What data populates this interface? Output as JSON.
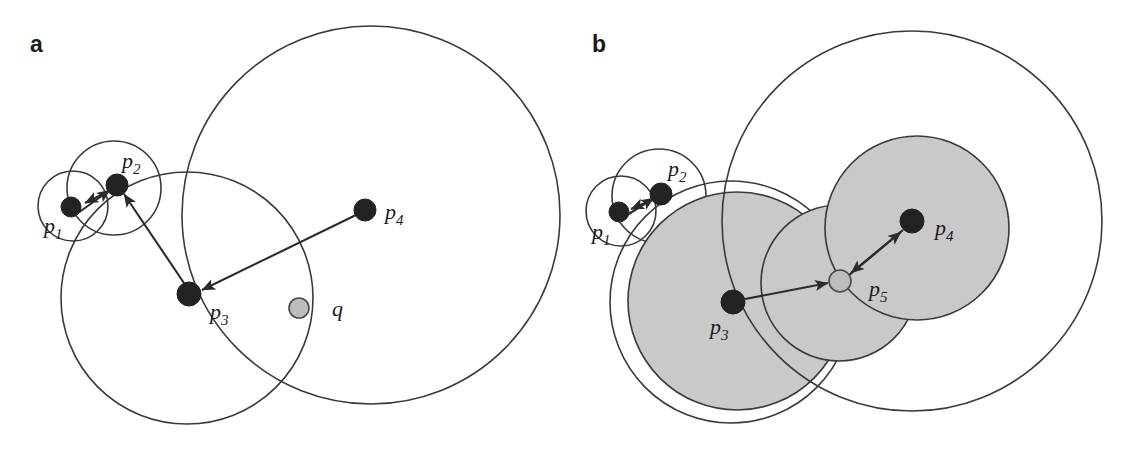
{
  "figure": {
    "background_color": "#ffffff",
    "stroke_color": "#3a3a3a",
    "shade_color": "#c9c9c9",
    "dark_point_color": "#232323",
    "light_point_color": "#bdbdbd",
    "width": 1131,
    "height": 451
  },
  "panels": [
    {
      "id": "a",
      "label": "a",
      "label_x": 30,
      "label_y": 52,
      "circles": [
        {
          "name": "circle-p1",
          "cx": 73,
          "cy": 206,
          "r": 35,
          "filled": false
        },
        {
          "name": "circle-p2",
          "cx": 114,
          "cy": 188,
          "r": 47,
          "filled": false
        },
        {
          "name": "circle-p3",
          "cx": 187,
          "cy": 298,
          "r": 126,
          "filled": false
        },
        {
          "name": "circle-p4",
          "cx": 371,
          "cy": 215,
          "r": 189,
          "filled": false
        }
      ],
      "points": [
        {
          "name": "point-p1",
          "cx": 71,
          "cy": 207,
          "r": 10,
          "shade": "dark"
        },
        {
          "name": "point-p2",
          "cx": 117,
          "cy": 185,
          "r": 11,
          "shade": "dark"
        },
        {
          "name": "point-p3",
          "cx": 189,
          "cy": 294,
          "r": 12,
          "shade": "dark"
        },
        {
          "name": "point-p4",
          "cx": 365,
          "cy": 210,
          "r": 11,
          "shade": "dark"
        },
        {
          "name": "point-q",
          "cx": 299,
          "cy": 308,
          "r": 10,
          "shade": "light"
        }
      ],
      "arrows": [
        {
          "name": "arrow-p2-to-p1",
          "x1": 117,
          "y1": 187,
          "x2": 85,
          "y2": 203
        },
        {
          "name": "arrow-p1-to-p2",
          "x1": 78,
          "y1": 213,
          "x2": 110,
          "y2": 190
        },
        {
          "name": "arrow-p3-to-p2",
          "x1": 186,
          "y1": 286,
          "x2": 124,
          "y2": 194
        },
        {
          "name": "arrow-p4-to-p3",
          "x1": 356,
          "y1": 215,
          "x2": 202,
          "y2": 290
        }
      ],
      "labels": [
        {
          "name": "label-p1",
          "base": "p",
          "sub": "1",
          "x": 44,
          "y": 233
        },
        {
          "name": "label-p2",
          "base": "p",
          "sub": "2",
          "x": 122,
          "y": 168
        },
        {
          "name": "label-p3",
          "base": "p",
          "sub": "3",
          "x": 210,
          "y": 319
        },
        {
          "name": "label-p4",
          "base": "p",
          "sub": "4",
          "x": 385,
          "y": 219
        },
        {
          "name": "label-q",
          "base": "q",
          "sub": "",
          "x": 332,
          "y": 316
        }
      ]
    },
    {
      "id": "b",
      "label": "b",
      "label_x": 592,
      "label_y": 52,
      "circles": [
        {
          "name": "circle-p1",
          "cx": 621,
          "cy": 211,
          "r": 35,
          "filled": false
        },
        {
          "name": "circle-p2",
          "cx": 659,
          "cy": 196,
          "r": 47,
          "filled": false
        },
        {
          "name": "circle-p3-outer",
          "cx": 731,
          "cy": 302,
          "r": 121,
          "filled": false
        },
        {
          "name": "circle-p3-shaded",
          "cx": 737,
          "cy": 301,
          "r": 109,
          "filled": true
        },
        {
          "name": "circle-p5-shaded",
          "cx": 839,
          "cy": 283,
          "r": 78,
          "filled": true
        },
        {
          "name": "circle-p4-shaded",
          "cx": 917,
          "cy": 228,
          "r": 92,
          "filled": true
        },
        {
          "name": "circle-p4-outer",
          "cx": 912,
          "cy": 221,
          "r": 190,
          "filled": false
        }
      ],
      "points": [
        {
          "name": "point-p1",
          "cx": 619,
          "cy": 212,
          "r": 10,
          "shade": "dark"
        },
        {
          "name": "point-p2",
          "cx": 661,
          "cy": 194,
          "r": 11,
          "shade": "dark"
        },
        {
          "name": "point-p3",
          "cx": 733,
          "cy": 302,
          "r": 12,
          "shade": "dark"
        },
        {
          "name": "point-p4",
          "cx": 912,
          "cy": 221,
          "r": 12,
          "shade": "dark"
        },
        {
          "name": "point-p5",
          "cx": 840,
          "cy": 281,
          "r": 11,
          "shade": "light"
        }
      ],
      "arrows": [
        {
          "name": "arrow-p2-to-p1",
          "x1": 661,
          "y1": 196,
          "x2": 631,
          "y2": 209
        },
        {
          "name": "arrow-p1-to-p2",
          "x1": 624,
          "y1": 217,
          "x2": 654,
          "y2": 198
        },
        {
          "name": "arrow-p3-to-p5",
          "x1": 745,
          "y1": 299,
          "x2": 828,
          "y2": 283
        },
        {
          "name": "arrow-p4-to-p5",
          "x1": 903,
          "y1": 230,
          "x2": 851,
          "y2": 273
        },
        {
          "name": "arrow-p5-to-p4",
          "x1": 848,
          "y1": 276,
          "x2": 901,
          "y2": 232
        }
      ],
      "labels": [
        {
          "name": "label-p1",
          "base": "p",
          "sub": "1",
          "x": 592,
          "y": 239
        },
        {
          "name": "label-p2",
          "base": "p",
          "sub": "2",
          "x": 668,
          "y": 176
        },
        {
          "name": "label-p3",
          "base": "p",
          "sub": "3",
          "x": 710,
          "y": 334
        },
        {
          "name": "label-p4",
          "base": "p",
          "sub": "4",
          "x": 935,
          "y": 235
        },
        {
          "name": "label-p5",
          "base": "p",
          "sub": "5",
          "x": 869,
          "y": 296
        }
      ]
    }
  ]
}
